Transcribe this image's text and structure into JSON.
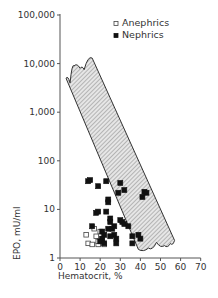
{
  "chart_data": {
    "type": "scatter",
    "title": "",
    "xlabel": "Hematocrit, %",
    "ylabel": "EPO, mU/ml",
    "xlim": [
      0,
      70
    ],
    "ylim": [
      1,
      100000
    ],
    "yscale": "log",
    "grid": false,
    "legend_position": "top-right",
    "x_ticks": [
      0,
      10,
      20,
      30,
      40,
      50,
      60,
      70
    ],
    "x_tick_labels": [
      "0",
      "10",
      "20",
      "30",
      "40",
      "50",
      "60",
      "70"
    ],
    "y_ticks": [
      1,
      10,
      100,
      1000,
      10000,
      100000
    ],
    "y_tick_labels": [
      "1",
      "10",
      "100",
      "1,000",
      "10,000",
      "100,000"
    ],
    "reference_band": {
      "description": "Hatched normal-response band (EPO vs hematocrit in anemia without renal disease)",
      "polygon": [
        [
          3,
          5000
        ],
        [
          5,
          4000
        ],
        [
          7,
          9000
        ],
        [
          10,
          8000
        ],
        [
          12,
          7500
        ],
        [
          16,
          13000
        ],
        [
          57,
          2.3
        ],
        [
          55,
          2.0
        ],
        [
          52,
          1.8
        ],
        [
          48,
          2.1
        ],
        [
          44,
          1.6
        ],
        [
          39,
          1.5
        ]
      ]
    },
    "series": [
      {
        "name": "Anephrics",
        "marker": "open-square",
        "points": [
          [
            13,
            3
          ],
          [
            14,
            2
          ],
          [
            17,
            4
          ],
          [
            16,
            1.9
          ],
          [
            18,
            2.8
          ],
          [
            19,
            1.9
          ],
          [
            20,
            3.5
          ],
          [
            21,
            2.5
          ],
          [
            22,
            1.9
          ],
          [
            19,
            2.2
          ]
        ]
      },
      {
        "name": "Nephrics",
        "marker": "filled-square",
        "points": [
          [
            14,
            38
          ],
          [
            15,
            40
          ],
          [
            23,
            38
          ],
          [
            30,
            35
          ],
          [
            32,
            25
          ],
          [
            29,
            22
          ],
          [
            19,
            30
          ],
          [
            24,
            16
          ],
          [
            24,
            14
          ],
          [
            23,
            9
          ],
          [
            18,
            8.5
          ],
          [
            19,
            9
          ],
          [
            41,
            18
          ],
          [
            42,
            23
          ],
          [
            43,
            22
          ],
          [
            25,
            6.5
          ],
          [
            25,
            5.5
          ],
          [
            30,
            6
          ],
          [
            31,
            5.5
          ],
          [
            32,
            5
          ],
          [
            34,
            4.5
          ],
          [
            16,
            4.5
          ],
          [
            21,
            3.5
          ],
          [
            22,
            3
          ],
          [
            24,
            4
          ],
          [
            26,
            4
          ],
          [
            27,
            3
          ],
          [
            28,
            2.5
          ],
          [
            21,
            2.5
          ],
          [
            20,
            2.2
          ],
          [
            25,
            2.8
          ],
          [
            28,
            2
          ],
          [
            36,
            2.8
          ],
          [
            36,
            2
          ],
          [
            39,
            3
          ],
          [
            40,
            2.5
          ],
          [
            22,
            2
          ],
          [
            27,
            4.5
          ]
        ]
      }
    ]
  },
  "legend": {
    "items": [
      {
        "label": "Anephrics",
        "marker": "open-square"
      },
      {
        "label": "Nephrics",
        "marker": "filled-square"
      }
    ]
  },
  "axes": {
    "x_title": "Hematocrit, %",
    "y_title": "EPO, mU/ml"
  }
}
